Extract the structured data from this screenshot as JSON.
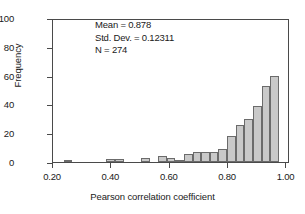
{
  "chart_data": {
    "type": "bar",
    "title": "",
    "xlabel": "Pearson correlation coefficient",
    "ylabel": "Frequency",
    "xlim": [
      0.2,
      1.012
    ],
    "ylim": [
      0,
      100
    ],
    "grid": false,
    "legend": null,
    "xticks": [
      "0.20",
      "0.40",
      "0.60",
      "0.80",
      "1.00"
    ],
    "xtick_values": [
      0.2,
      0.4,
      0.6,
      0.8,
      1.0
    ],
    "yticks": [
      "0",
      "20",
      "40",
      "60",
      "80",
      "100"
    ],
    "ytick_values": [
      0,
      20,
      40,
      60,
      80,
      100
    ],
    "bin_width": 0.0295,
    "x": [
      0.2505,
      0.398,
      0.4275,
      0.516,
      0.575,
      0.6045,
      0.634,
      0.6635,
      0.693,
      0.7225,
      0.752,
      0.7815,
      0.811,
      0.8405,
      0.87,
      0.8995,
      0.929,
      0.9585,
      0.988
    ],
    "values": [
      1,
      2,
      2,
      2.5,
      4,
      3,
      1.5,
      5.5,
      7,
      7,
      7,
      9,
      18,
      25.5,
      30,
      39,
      53,
      60,
      0
    ],
    "series": [
      {
        "name": "Frequency",
        "values": [
          1,
          2,
          2,
          2.5,
          4,
          3,
          1.5,
          5.5,
          7,
          7,
          7,
          9,
          18,
          25.5,
          30,
          39,
          53,
          60,
          0
        ]
      }
    ],
    "bars": [
      {
        "x0": 0.236,
        "x1": 0.2655,
        "height": 1
      },
      {
        "x0": 0.383,
        "x1": 0.4125,
        "height": 2
      },
      {
        "x0": 0.4125,
        "x1": 0.442,
        "height": 2
      },
      {
        "x0": 0.5015,
        "x1": 0.531,
        "height": 2.5
      },
      {
        "x0": 0.5605,
        "x1": 0.59,
        "height": 4
      },
      {
        "x0": 0.59,
        "x1": 0.6195,
        "height": 3
      },
      {
        "x0": 0.6195,
        "x1": 0.649,
        "height": 1.5
      },
      {
        "x0": 0.649,
        "x1": 0.6785,
        "height": 5.5
      },
      {
        "x0": 0.6785,
        "x1": 0.708,
        "height": 7
      },
      {
        "x0": 0.708,
        "x1": 0.7375,
        "height": 7
      },
      {
        "x0": 0.7375,
        "x1": 0.767,
        "height": 7
      },
      {
        "x0": 0.767,
        "x1": 0.7965,
        "height": 9
      },
      {
        "x0": 0.7965,
        "x1": 0.826,
        "height": 18
      },
      {
        "x0": 0.826,
        "x1": 0.8555,
        "height": 25.5
      },
      {
        "x0": 0.8555,
        "x1": 0.885,
        "height": 30
      },
      {
        "x0": 0.885,
        "x1": 0.9145,
        "height": 39
      },
      {
        "x0": 0.9145,
        "x1": 0.944,
        "height": 53
      },
      {
        "x0": 0.944,
        "x1": 0.9735,
        "height": 60
      }
    ],
    "annotations": [
      "Mean = 0.878",
      "Std. Dev. = 0.12311",
      "N = 274"
    ],
    "colors": {
      "bar_fill": "#c9c9c9",
      "bar_edge": "#6b6b6b",
      "axis": "#4a4a4a",
      "text": "#1a1a1a",
      "background": "#ffffff"
    }
  },
  "stats": {
    "mean_label": "Mean = 0.878",
    "stddev_label": "Std. Dev. = 0.12311",
    "n_label": "N = 274"
  }
}
